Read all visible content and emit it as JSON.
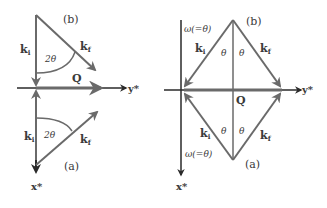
{
  "colors": {
    "line": "#6a6a6a",
    "axis": "#2a2a2a",
    "text": "#3a3a3a",
    "background": "#ffffff"
  },
  "left_diagram": {
    "axis_x_label": "x*",
    "axis_y_label": "y*",
    "q_label": "Q",
    "panel_b": {
      "label": "(b)",
      "ki": "k",
      "ki_sub": "i",
      "kf": "k",
      "kf_sub": "f",
      "angle": "2θ"
    },
    "panel_a": {
      "label": "(a)",
      "ki": "k",
      "ki_sub": "i",
      "kf": "k",
      "kf_sub": "f",
      "angle": "2θ"
    }
  },
  "right_diagram": {
    "axis_x_label": "x*",
    "axis_y_label": "y*",
    "q_label": "Q",
    "panel_b": {
      "label": "(b)",
      "omega": "ω(=θ)",
      "ki": "k",
      "ki_sub": "i",
      "kf": "k",
      "kf_sub": "f",
      "theta_left": "θ",
      "theta_right": "θ"
    },
    "panel_a": {
      "label": "(a)",
      "omega": "ω(=θ)",
      "ki": "k",
      "ki_sub": "i",
      "kf": "k",
      "kf_sub": "f",
      "theta_left": "θ",
      "theta_right": "θ"
    }
  }
}
